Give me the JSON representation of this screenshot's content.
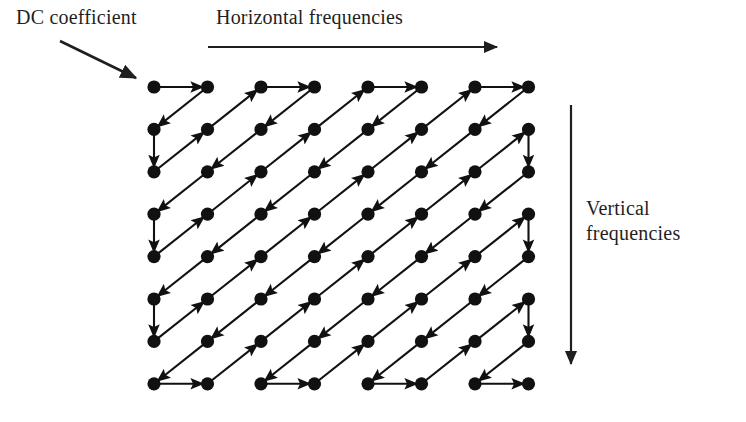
{
  "figure": {
    "grid": {
      "rows": 8,
      "cols": 8,
      "origin_x": 154,
      "origin_y": 87,
      "step_x": 53.5,
      "step_y": 42.4,
      "dot_radius": 6.6,
      "dot_color": "#111111"
    },
    "stroke_color": "#111111",
    "stroke_width": 2.1,
    "background_color": "#ffffff"
  },
  "labels": {
    "dc_coefficient": "DC coefficient",
    "horizontal_frequencies": "Horizontal frequencies",
    "vertical_frequencies": "Vertical frequencies"
  },
  "annotations": {
    "dc_arrow": {
      "name": "dc-pointer-arrow",
      "x1": 60,
      "y1": 41,
      "x2": 136,
      "y2": 78
    },
    "horizontal_arrow": {
      "name": "horizontal-frequencies-arrow",
      "x1": 208,
      "y1": 47,
      "x2": 497,
      "y2": 47
    },
    "vertical_arrow": {
      "name": "vertical-frequencies-arrow",
      "x1": 571,
      "y1": 105,
      "x2": 571,
      "y2": 364
    }
  },
  "chart_data": {
    "type": "diagram",
    "xlabel": "Horizontal frequencies",
    "ylabel": "Vertical frequencies",
    "nodes_count": 64,
    "zigzag_order": [
      [
        0,
        0
      ],
      [
        1,
        0
      ],
      [
        0,
        1
      ],
      [
        0,
        2
      ],
      [
        1,
        1
      ],
      [
        2,
        0
      ],
      [
        3,
        0
      ],
      [
        2,
        1
      ],
      [
        1,
        2
      ],
      [
        0,
        3
      ],
      [
        0,
        4
      ],
      [
        1,
        3
      ],
      [
        2,
        2
      ],
      [
        3,
        1
      ],
      [
        4,
        0
      ],
      [
        5,
        0
      ],
      [
        4,
        1
      ],
      [
        3,
        2
      ],
      [
        2,
        3
      ],
      [
        1,
        4
      ],
      [
        0,
        5
      ],
      [
        0,
        6
      ],
      [
        1,
        5
      ],
      [
        2,
        4
      ],
      [
        3,
        3
      ],
      [
        4,
        2
      ],
      [
        5,
        1
      ],
      [
        6,
        0
      ],
      [
        7,
        0
      ],
      [
        6,
        1
      ],
      [
        5,
        2
      ],
      [
        4,
        3
      ],
      [
        3,
        4
      ],
      [
        2,
        5
      ],
      [
        1,
        6
      ],
      [
        0,
        7
      ],
      [
        1,
        7
      ],
      [
        2,
        6
      ],
      [
        3,
        5
      ],
      [
        4,
        4
      ],
      [
        5,
        3
      ],
      [
        6,
        2
      ],
      [
        7,
        1
      ],
      [
        7,
        2
      ],
      [
        6,
        3
      ],
      [
        5,
        4
      ],
      [
        4,
        5
      ],
      [
        3,
        6
      ],
      [
        2,
        7
      ],
      [
        3,
        7
      ],
      [
        4,
        6
      ],
      [
        5,
        5
      ],
      [
        6,
        4
      ],
      [
        7,
        3
      ],
      [
        7,
        4
      ],
      [
        6,
        5
      ],
      [
        5,
        6
      ],
      [
        4,
        7
      ],
      [
        5,
        7
      ],
      [
        6,
        6
      ],
      [
        7,
        5
      ],
      [
        7,
        6
      ],
      [
        6,
        7
      ],
      [
        7,
        7
      ]
    ]
  }
}
